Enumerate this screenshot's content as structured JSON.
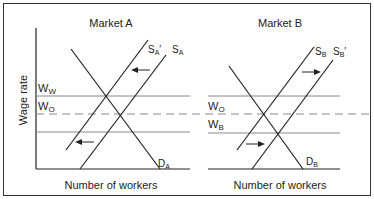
{
  "panels": [
    {
      "title": "Market A",
      "xlabel": "Number of workers",
      "supply_new": "S",
      "supply_new_sub": "A",
      "supply_new_prime": "′",
      "supply_old": "S",
      "supply_old_sub": "A",
      "demand": "D",
      "demand_sub": "A"
    },
    {
      "title": "Market B",
      "xlabel": "Number of workers",
      "supply_old": "S",
      "supply_old_sub": "B",
      "supply_new": "S",
      "supply_new_sub": "B",
      "supply_new_prime": "′",
      "demand": "D",
      "demand_sub": "B"
    }
  ],
  "ylabel": "Wage rate",
  "wage_labels": {
    "ww": "W",
    "ww_sub": "W",
    "wo_a": "W",
    "wo_a_sub": "O",
    "wo_b": "W",
    "wo_b_sub": "O",
    "wb": "W",
    "wb_sub": "B"
  },
  "colors": {
    "line": "#222222",
    "grid": "#888888",
    "border": "#333333"
  }
}
